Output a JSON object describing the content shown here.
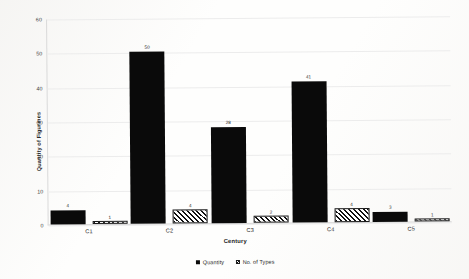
{
  "chart_data": {
    "type": "bar",
    "title": "",
    "xlabel": "Century",
    "ylabel": "Quantity of Figurines",
    "categories": [
      "C1",
      "C2",
      "C3",
      "C4",
      "C5"
    ],
    "series": [
      {
        "name": "Quantity",
        "values": [
          4,
          50,
          28,
          41,
          3
        ]
      },
      {
        "name": "No. of Types",
        "values": [
          1,
          4,
          2,
          4,
          1
        ]
      }
    ],
    "ylim": [
      0,
      60
    ],
    "yticks": [
      0,
      10,
      20,
      30,
      40,
      50,
      60
    ],
    "grid": true,
    "legend_position": "bottom",
    "show_value_labels": true,
    "colors": {
      "quantity": "#0a0a0a",
      "types_outline": "#1a1a1a",
      "types_fill": "#ffffff",
      "gridline": "#ececec",
      "axis": "#d4d4d4",
      "background": "#fefefd"
    }
  }
}
